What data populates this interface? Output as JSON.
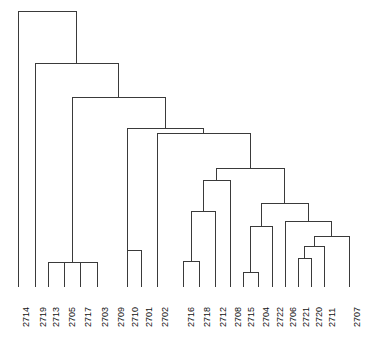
{
  "figure": {
    "kind": "dendrogram",
    "background_color": "#ffffff",
    "line_color": "#3a3a3a",
    "label_color": "#111111",
    "width": 367,
    "height": 343
  },
  "chart_data": {
    "type": "line",
    "title": "",
    "subtitle": "",
    "xlabel": "",
    "ylabel": "",
    "grid": false,
    "legend": "none",
    "orientation": "top-down-vertical",
    "axis_note": "Merge heights read off pixel y-coordinates; smaller y = earlier/higher merge (root at top).",
    "leaf_order": [
      "2714",
      "2719",
      "2713",
      "2705",
      "2717",
      "2703",
      "2709",
      "2710",
      "2701",
      "2702",
      "2716",
      "2718",
      "2712",
      "2708",
      "2715",
      "2704",
      "2722",
      "2706",
      "2721",
      "2720",
      "2711",
      "2707"
    ],
    "leaf_count": 22,
    "leaf_x": [
      18,
      35,
      48,
      64,
      80,
      97,
      113,
      127,
      141,
      157,
      183,
      199,
      215,
      230,
      243,
      258,
      272,
      285,
      298,
      311,
      324,
      349
    ],
    "baseline_y": 287,
    "ylim": [
      11,
      287
    ],
    "tick_labels": [
      "2714",
      "2719",
      "2713",
      "2705",
      "2717",
      "2703",
      "2709",
      "2710",
      "2701",
      "2702",
      "2716",
      "2718",
      "2712",
      "2708",
      "2715",
      "2704",
      "2722",
      "2706",
      "2721",
      "2720",
      "2711",
      "2707"
    ],
    "merges": [
      {
        "id": "m1",
        "left": "2713",
        "right": "2703",
        "height_y": 262,
        "x_left": 48,
        "x_right": 97,
        "x_mid": 72
      },
      {
        "id": "m2",
        "left": "m1a",
        "right": "m1b",
        "height_y": 262,
        "x_left": 64,
        "x_right": 80,
        "x_mid": 72
      },
      {
        "id": "m3",
        "left": "2710",
        "right": "2701",
        "height_y": 250,
        "x_left": 113,
        "x_right": 141,
        "x_mid": 127
      },
      {
        "id": "m4",
        "left": "2716",
        "right": "2718",
        "height_y": 261,
        "x_left": 183,
        "x_right": 199,
        "x_mid": 191
      },
      {
        "id": "m5",
        "left": "m4",
        "right": "2712",
        "height_y": 211,
        "x_left": 191,
        "x_right": 215,
        "x_mid": 203
      },
      {
        "id": "m6",
        "left": "m5",
        "right": "2708",
        "height_y": 180,
        "x_left": 203,
        "x_right": 230,
        "x_mid": 216
      },
      {
        "id": "m7",
        "left": "2715",
        "right": "2704",
        "height_y": 272,
        "x_left": 243,
        "x_right": 258,
        "x_mid": 250
      },
      {
        "id": "m8",
        "left": "m7",
        "right": "2722",
        "height_y": 226,
        "x_left": 250,
        "x_right": 272,
        "x_mid": 261
      },
      {
        "id": "m9",
        "left": "2721",
        "right": "2720",
        "height_y": 258,
        "x_left": 298,
        "x_right": 311,
        "x_mid": 304
      },
      {
        "id": "m10",
        "left": "m9",
        "right": "2711",
        "height_y": 246,
        "x_left": 304,
        "x_right": 324,
        "x_mid": 314
      },
      {
        "id": "m11",
        "left": "m10",
        "right": "2707",
        "height_y": 236,
        "x_left": 314,
        "x_right": 349,
        "x_mid": 331
      },
      {
        "id": "m12",
        "left": "2706",
        "right": "m11",
        "height_y": 221,
        "x_left": 285,
        "x_right": 331,
        "x_mid": 308
      },
      {
        "id": "m13",
        "left": "m8",
        "right": "m12",
        "height_y": 203,
        "x_left": 261,
        "x_right": 308,
        "x_mid": 284
      },
      {
        "id": "m14",
        "left": "m6",
        "right": "m13",
        "height_y": 168,
        "x_left": 216,
        "x_right": 284,
        "x_mid": 250
      },
      {
        "id": "m15",
        "left": "2702",
        "right": "m14",
        "height_y": 133,
        "x_left": 157,
        "x_right": 250,
        "x_mid": 203
      },
      {
        "id": "m16",
        "left": "m3",
        "right": "m15",
        "height_y": 128,
        "x_left": 127,
        "x_right": 203,
        "x_mid": 165
      },
      {
        "id": "m17",
        "left": "m2",
        "right": "m16",
        "height_y": 97,
        "x_left": 72,
        "x_right": 165,
        "x_mid": 118
      },
      {
        "id": "m18",
        "left": "2719",
        "right": "m17",
        "height_y": 63,
        "x_left": 35,
        "x_right": 118,
        "x_mid": 76
      },
      {
        "id": "m19",
        "left": "2714",
        "right": "m18",
        "height_y": 11,
        "x_left": 18,
        "x_right": 76,
        "x_mid": 47
      }
    ]
  }
}
